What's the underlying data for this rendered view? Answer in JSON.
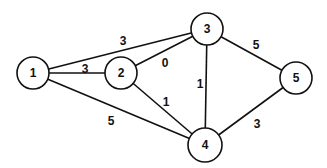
{
  "diagram": {
    "type": "weighted-undirected-graph",
    "nodes": [
      {
        "id": "1",
        "label": "1",
        "x": 33,
        "y": 73,
        "r": 16
      },
      {
        "id": "2",
        "label": "2",
        "x": 121,
        "y": 73,
        "r": 16
      },
      {
        "id": "3",
        "label": "3",
        "x": 207,
        "y": 29,
        "r": 16
      },
      {
        "id": "4",
        "label": "4",
        "x": 205,
        "y": 145,
        "r": 17
      },
      {
        "id": "5",
        "label": "5",
        "x": 296,
        "y": 78,
        "r": 16
      }
    ],
    "edges": [
      {
        "from": "1",
        "to": "3",
        "weight": "3",
        "lx": 123,
        "ly": 42
      },
      {
        "from": "1",
        "to": "2",
        "weight": "3",
        "lx": 85,
        "ly": 70
      },
      {
        "from": "2",
        "to": "3",
        "weight": "0",
        "lx": 165,
        "ly": 64
      },
      {
        "from": "1",
        "to": "4",
        "weight": "5",
        "lx": 111,
        "ly": 122
      },
      {
        "from": "2",
        "to": "4",
        "weight": "1",
        "lx": 166,
        "ly": 103
      },
      {
        "from": "3",
        "to": "4",
        "weight": "1",
        "lx": 200,
        "ly": 85
      },
      {
        "from": "3",
        "to": "5",
        "weight": "5",
        "lx": 256,
        "ly": 46
      },
      {
        "from": "4",
        "to": "5",
        "weight": "3",
        "lx": 257,
        "ly": 125
      }
    ]
  }
}
